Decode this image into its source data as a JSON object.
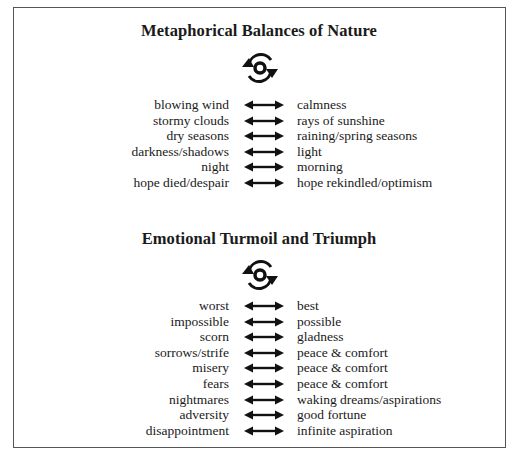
{
  "sections": [
    {
      "title": "Metaphorical Balances of Nature",
      "icon": "cycle-arrows-icon",
      "pairs": [
        {
          "left": "blowing wind",
          "right": "calmness"
        },
        {
          "left": "stormy clouds",
          "right": "rays of sunshine"
        },
        {
          "left": "dry seasons",
          "right": "raining/spring seasons"
        },
        {
          "left": "darkness/shadows",
          "right": "light"
        },
        {
          "left": "night",
          "right": "morning"
        },
        {
          "left": "hope died/despair",
          "right": "hope rekindled/optimism"
        }
      ]
    },
    {
      "title": "Emotional Turmoil and Triumph",
      "icon": "cycle-arrows-icon",
      "pairs": [
        {
          "left": "worst",
          "right": "best"
        },
        {
          "left": "impossible",
          "right": "possible"
        },
        {
          "left": "scorn",
          "right": "gladness"
        },
        {
          "left": "sorrows/strife",
          "right": "peace & comfort"
        },
        {
          "left": "misery",
          "right": "peace & comfort"
        },
        {
          "left": "fears",
          "right": "peace & comfort"
        },
        {
          "left": "nightmares",
          "right": "waking dreams/aspirations"
        },
        {
          "left": "adversity",
          "right": "good fortune"
        },
        {
          "left": "disappointment",
          "right": "infinite aspiration"
        }
      ]
    }
  ],
  "connector_icon": "double-arrow-icon",
  "colors": {
    "ink": "#1a1a1a",
    "frame": "#555555",
    "background": "#ffffff"
  }
}
